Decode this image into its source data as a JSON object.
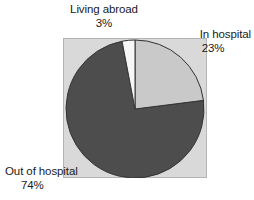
{
  "chart_data": {
    "type": "pie",
    "title": "",
    "categories": [
      "In hospital",
      "Out of hospital",
      "Living abroad"
    ],
    "values": [
      23,
      74,
      3
    ],
    "value_unit": "%",
    "slices": [
      {
        "label": "In hospital",
        "value": 23,
        "value_text": "23%",
        "color": "#c9c9c9",
        "start_angle_deg": 0,
        "end_angle_deg": 82.8
      },
      {
        "label": "Out of hospital",
        "value": 74,
        "value_text": "74%",
        "color": "#4d4d4d",
        "start_angle_deg": 82.8,
        "end_angle_deg": 349.2
      },
      {
        "label": "Living abroad",
        "value": 3,
        "value_text": "3%",
        "color": "#f7f7f7",
        "start_angle_deg": 349.2,
        "end_angle_deg": 360
      }
    ],
    "start_angle": "12 o'clock",
    "direction": "clockwise",
    "legend": "none (direct labels)",
    "plot_background": "#d9d9d9",
    "slice_outline": "#333333"
  },
  "labels": {
    "living_abroad": {
      "name": "Living abroad",
      "percent": "3%"
    },
    "in_hospital": {
      "name": "In hospital",
      "percent": "23%"
    },
    "out_of_hospital": {
      "name": "Out of hospital",
      "percent": "74%"
    }
  }
}
